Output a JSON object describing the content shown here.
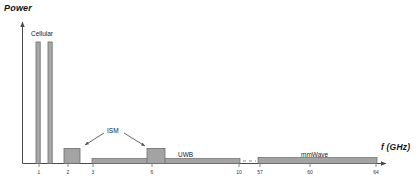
{
  "figure": {
    "ylabel": "Power",
    "xlabel": "f (GHz)",
    "background": "#ffffff",
    "bar_fill": "#a3a3a3",
    "bar_stroke": "#6b6b6b",
    "axis_color": "#4a4a4a"
  },
  "labels": {
    "cellular": "Cellular",
    "ism": "ISM",
    "uwb": "UWB",
    "mmwave": "mmWave"
  },
  "ticks": [
    {
      "text": "1",
      "x": 39
    },
    {
      "text": "2",
      "x": 68
    },
    {
      "text": "3",
      "x": 93
    },
    {
      "text": "6",
      "x": 152
    },
    {
      "text": "10",
      "x": 239
    },
    {
      "text": "57",
      "x": 260
    },
    {
      "text": "60",
      "x": 310
    },
    {
      "text": "64",
      "x": 376
    }
  ],
  "chart_data": {
    "type": "bar",
    "title": "",
    "xlabel": "f (GHz)",
    "ylabel": "Power",
    "xscale": "piecewise-broken",
    "xlim": [
      0,
      64
    ],
    "ylim": [
      0,
      1
    ],
    "grid": false,
    "legend": false,
    "axis_break": {
      "after": 10,
      "before": 57,
      "style": "dashed"
    },
    "tick_labels": [
      "1",
      "2",
      "3",
      "6",
      "10",
      "57",
      "60",
      "64"
    ],
    "tick_values": [
      1,
      2,
      3,
      6,
      10,
      57,
      60,
      64
    ],
    "bands": [
      {
        "name": "Cellular",
        "f_start": 0.9,
        "f_end": 1.0,
        "power": 0.92,
        "kind": "narrowband"
      },
      {
        "name": "Cellular",
        "f_start": 1.7,
        "f_end": 1.8,
        "power": 0.92,
        "kind": "narrowband"
      },
      {
        "name": "ISM",
        "f_start": 2.0,
        "f_end": 2.5,
        "power": 0.13,
        "kind": "block"
      },
      {
        "name": "UWB",
        "f_start": 3.0,
        "f_end": 10.0,
        "power": 0.035,
        "kind": "wideband-floor"
      },
      {
        "name": "ISM",
        "f_start": 5.7,
        "f_end": 6.3,
        "power": 0.13,
        "kind": "block"
      },
      {
        "name": "mmWave",
        "f_start": 57.0,
        "f_end": 64.0,
        "power": 0.045,
        "kind": "wideband-floor"
      }
    ],
    "annotations": [
      {
        "text": "Cellular",
        "points_to": "narrowband pair at 1 and 2 GHz"
      },
      {
        "text": "ISM",
        "points_to": "2.4 GHz and 6 GHz blocks",
        "arrows": 2
      },
      {
        "text": "UWB",
        "points_to": "3-10 GHz floor"
      },
      {
        "text": "mmWave",
        "points_to": "57-64 GHz band"
      }
    ]
  }
}
